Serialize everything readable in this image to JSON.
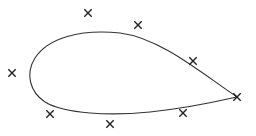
{
  "diagram": {
    "type": "closed-curve-with-control-points",
    "stroke_color": "#333333",
    "marker_color": "#222222",
    "background": "#ffffff",
    "curve_path": "M 237 97 C 200 72, 160 38, 120 33 C 80 29, 48 38, 35 58 C 25 74, 30 92, 45 102 C 65 114, 110 116, 150 112 C 190 108, 215 102, 237 97 Z",
    "markers": [
      {
        "id": "p1",
        "x": 88,
        "y": 13,
        "icon": "cross-mark"
      },
      {
        "id": "p2",
        "x": 138,
        "y": 25,
        "icon": "cross-mark"
      },
      {
        "id": "p3",
        "x": 12,
        "y": 73,
        "icon": "cross-mark"
      },
      {
        "id": "p4",
        "x": 50,
        "y": 114,
        "icon": "cross-mark"
      },
      {
        "id": "p5",
        "x": 110,
        "y": 124,
        "icon": "cross-mark"
      },
      {
        "id": "p6",
        "x": 183,
        "y": 113,
        "icon": "cross-mark"
      },
      {
        "id": "p7",
        "x": 193,
        "y": 61,
        "icon": "cross-mark"
      },
      {
        "id": "p8",
        "x": 237,
        "y": 97,
        "icon": "cross-mark"
      }
    ]
  }
}
